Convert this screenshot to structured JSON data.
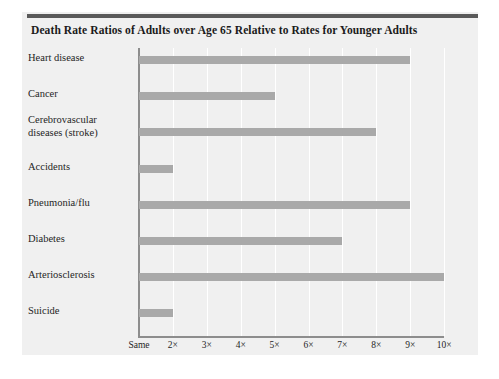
{
  "chart_data": {
    "type": "bar",
    "orientation": "horizontal",
    "title": "Death Rate Ratios of Adults over Age 65 Relative to Rates for Younger Adults",
    "xlabel": "",
    "ylabel": "",
    "categories": [
      "Heart disease",
      "Cancer",
      "Cerebrovascular diseases (stroke)",
      "Accidents",
      "Pneumonia/flu",
      "Diabetes",
      "Arteriosclerosis",
      "Suicide"
    ],
    "values": [
      9,
      5,
      8,
      2,
      9,
      7,
      10,
      2
    ],
    "xlim": [
      1,
      10.6
    ],
    "xtick_values": [
      1,
      2,
      3,
      4,
      5,
      6,
      7,
      8,
      9,
      10
    ],
    "xtick_labels": [
      "Same",
      "2×",
      "3×",
      "4×",
      "5×",
      "6×",
      "7×",
      "8×",
      "9×",
      "10×"
    ],
    "grid": true,
    "grid_axis": "x",
    "legend": null,
    "bar_color": "#a9a9a9",
    "panel_color": "#f0f0f0",
    "gridline_color": "#ffffff",
    "axis_color": "#8d8d8d",
    "rule_color": "#5a5a5a"
  },
  "labels": {
    "cerebrovascular_line1": "Cerebrovascular",
    "cerebrovascular_line2": "diseases (stroke)"
  }
}
